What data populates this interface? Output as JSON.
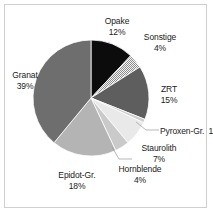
{
  "chart_data": {
    "type": "pie",
    "title": "",
    "subtitle": "",
    "xlabel": "",
    "ylabel": "",
    "grid": false,
    "legend_position": "none",
    "label_format": "name + percent",
    "start_angle_deg": 0,
    "direction": "clockwise",
    "categories": [
      "Opake",
      "Sonstige",
      "ZRT",
      "Pyroxen-Gr.",
      "Staurolith",
      "Hornblende",
      "Epidot-Gr.",
      "Granat"
    ],
    "values": [
      12,
      4,
      15,
      1,
      7,
      4,
      18,
      39
    ],
    "value_labels": [
      "12%",
      "4%",
      "15%",
      "1%",
      "7%",
      "4%",
      "18%",
      "39%"
    ],
    "units": "percent",
    "total": 100,
    "slices": [
      {
        "name": "Opake",
        "value": 12,
        "value_label": "12%",
        "fill": "#0c0c0c",
        "pattern": "solid"
      },
      {
        "name": "Sonstige",
        "value": 4,
        "value_label": "4%",
        "fill": "#d8d8d8",
        "pattern": "checkerboard"
      },
      {
        "name": "ZRT",
        "value": 15,
        "value_label": "15%",
        "fill": "#5e5e5e",
        "pattern": "solid"
      },
      {
        "name": "Pyroxen-Gr.",
        "value": 1,
        "value_label": "1%",
        "fill": "#cdcdcd",
        "pattern": "solid"
      },
      {
        "name": "Staurolith",
        "value": 7,
        "value_label": "7%",
        "fill": "#e9e9e9",
        "pattern": "solid"
      },
      {
        "name": "Hornblende",
        "value": 4,
        "value_label": "4%",
        "fill": "#cacaca",
        "pattern": "solid"
      },
      {
        "name": "Epidot-Gr.",
        "value": 18,
        "value_label": "18%",
        "fill": "#b4b4b4",
        "pattern": "solid"
      },
      {
        "name": "Granat",
        "value": 39,
        "value_label": "39%",
        "fill": "#6e6e6e",
        "pattern": "solid"
      }
    ]
  },
  "labels": {
    "opake": {
      "name": "Opake",
      "value": "12%"
    },
    "sonstige": {
      "name": "Sonstige",
      "value": "4%"
    },
    "zrt": {
      "name": "ZRT",
      "value": "15%"
    },
    "pyroxen": {
      "name": "Pyroxen-Gr.",
      "value": "1%"
    },
    "staurolith": {
      "name": "Staurolith",
      "value": "7%"
    },
    "hornblende": {
      "name": "Hornblende",
      "value": "4%"
    },
    "epidot": {
      "name": "Epidot-Gr.",
      "value": "18%"
    },
    "granat": {
      "name": "Granat",
      "value": "39%"
    }
  },
  "style": {
    "background": "#ffffff",
    "border_color": "#cfcfcf",
    "slice_outline": "#ffffff",
    "text_color": "#1a1a1a",
    "leader_line_color": "#9a9a9a"
  },
  "geometry": {
    "center_x": 91,
    "center_y": 98,
    "radius": 58
  }
}
